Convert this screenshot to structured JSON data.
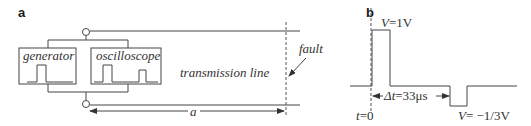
{
  "panel_a": {
    "label": "a",
    "generator_label": "generator",
    "oscilloscope_label": "oscilloscope",
    "line_label": "transmission line",
    "fault_label": "fault",
    "distance_label": "a"
  },
  "panel_b": {
    "label": "b",
    "v_high_sym": "V",
    "v_high_val": "=1V",
    "t0_sym": "t",
    "t0_val": "=0",
    "dt_sym": "Δt",
    "dt_val": "=33μs",
    "v_low_sym": "V",
    "v_low_val": "= −1/3V"
  }
}
